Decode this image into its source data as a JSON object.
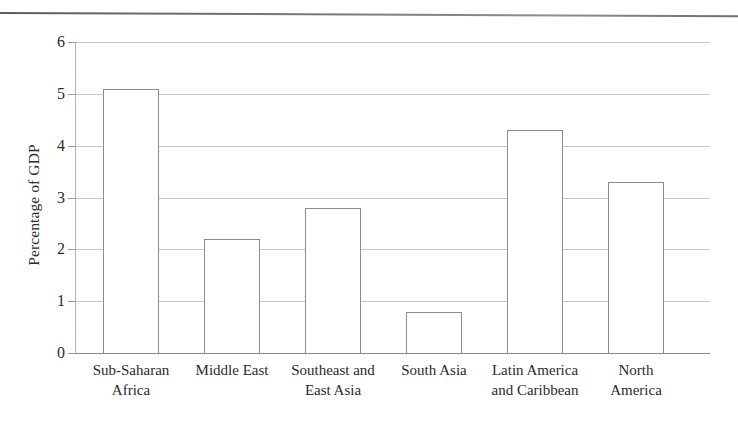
{
  "figure": {
    "page_rule": "horizontal-rule",
    "axis_color": "#8d8d8d",
    "grid_color": "#c8c8c8"
  },
  "chart_data": {
    "type": "bar",
    "title": "",
    "xlabel": "",
    "ylabel": "Percentage of GDP",
    "ylim": [
      0,
      6
    ],
    "yticks": [
      0,
      1,
      2,
      3,
      4,
      5,
      6
    ],
    "ytick_labels": [
      "0",
      "1",
      "2",
      "3",
      "4",
      "5",
      "6"
    ],
    "grid": true,
    "legend": false,
    "categories": [
      "Sub-Saharan\nAfrica",
      "Middle East",
      "Southeast and\nEast Asia",
      "South Asia",
      "Latin America\nand Caribbean",
      "North\nAmerica"
    ],
    "values": [
      5.1,
      2.2,
      2.8,
      0.8,
      4.3,
      3.3
    ]
  }
}
